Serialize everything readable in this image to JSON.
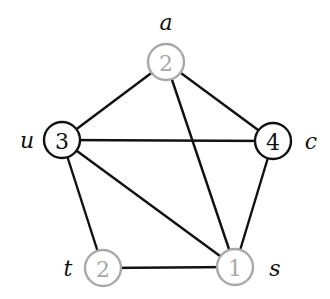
{
  "graph": {
    "node_radius": 18,
    "colors": {
      "active": "#111111",
      "inactive": "#a8a8a8",
      "edge": "#111111"
    },
    "nodes": [
      {
        "id": "a",
        "label": "a",
        "value": "2",
        "state": "inactive",
        "x": 166,
        "y": 62,
        "label_x": 166,
        "label_y": 22
      },
      {
        "id": "u",
        "label": "u",
        "value": "3",
        "state": "active",
        "x": 62,
        "y": 140,
        "label_x": 27,
        "label_y": 140
      },
      {
        "id": "c",
        "label": "c",
        "value": "4",
        "state": "active",
        "x": 273,
        "y": 141,
        "label_x": 311,
        "label_y": 141
      },
      {
        "id": "t",
        "label": "t",
        "value": "2",
        "state": "inactive",
        "x": 103,
        "y": 268,
        "label_x": 68,
        "label_y": 268
      },
      {
        "id": "s",
        "label": "s",
        "value": "1",
        "state": "inactive",
        "x": 235,
        "y": 267,
        "label_x": 275,
        "label_y": 268
      }
    ],
    "edges": [
      [
        "a",
        "u"
      ],
      [
        "a",
        "c"
      ],
      [
        "a",
        "s"
      ],
      [
        "u",
        "c"
      ],
      [
        "u",
        "s"
      ],
      [
        "u",
        "t"
      ],
      [
        "c",
        "s"
      ],
      [
        "t",
        "s"
      ]
    ]
  }
}
